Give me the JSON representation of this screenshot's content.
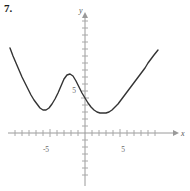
{
  "problem": {
    "number": "7."
  },
  "axes": {
    "x_axis_label": "x",
    "y_axis_label": "y",
    "x_tick_labels": [
      {
        "text": "-5",
        "value": -5
      },
      {
        "text": "5",
        "value": 5
      }
    ],
    "y_tick_labels": [
      {
        "text": "5",
        "value": 5
      }
    ],
    "axis_color": "#9a9a9a",
    "tick_color": "#a8a8a8",
    "label_color": "#6b6b6b"
  },
  "chart_data": {
    "type": "line",
    "title": "",
    "subtitle": "",
    "xlabel": "x",
    "ylabel": "y",
    "xlim": [
      -11,
      12
    ],
    "ylim": [
      -7,
      22
    ],
    "grid": false,
    "legend": null,
    "x_ticks": [
      -10,
      -9,
      -8,
      -7,
      -6,
      -5,
      -4,
      -3,
      -2,
      -1,
      1,
      2,
      3,
      4,
      5,
      6,
      7,
      8,
      9,
      10
    ],
    "x_tick_labels_shown": [
      -5,
      5
    ],
    "y_ticks": [
      -6,
      -5,
      -4,
      -3,
      -2,
      -1,
      1,
      2,
      3,
      4,
      5,
      6,
      7,
      8,
      9,
      10,
      11,
      12,
      13,
      14,
      15,
      16,
      17,
      18,
      19,
      20
    ],
    "y_tick_labels_shown": [
      5
    ],
    "tick_unit_px": 7,
    "origin_px": {
      "x": 85,
      "y": 133
    },
    "series": [
      {
        "name": "quartic-curve",
        "color": "#333333",
        "line_width": 1.4,
        "description": "W-shaped quartic with two local minima and one local maximum, entirely above the x-axis",
        "features": {
          "left_endpoint": {
            "x": -10.7,
            "y": 12.1
          },
          "local_min_left": {
            "x": -6.0,
            "y": 3.3
          },
          "local_max": {
            "x": -2.9,
            "y": 8.3
          },
          "local_min_right": {
            "x": 2.9,
            "y": 2.9
          },
          "right_endpoint": {
            "x": 10.4,
            "y": 11.9
          }
        },
        "points_px": [
          [
            10,
            48
          ],
          [
            13,
            56
          ],
          [
            16,
            63
          ],
          [
            19,
            70
          ],
          [
            22,
            77
          ],
          [
            25,
            83
          ],
          [
            28,
            89
          ],
          [
            31,
            95
          ],
          [
            34,
            100
          ],
          [
            37,
            104
          ],
          [
            40,
            108
          ],
          [
            43,
            110
          ],
          [
            46,
            110
          ],
          [
            49,
            108
          ],
          [
            52,
            104
          ],
          [
            55,
            99
          ],
          [
            58,
            93
          ],
          [
            61,
            86
          ],
          [
            64,
            79
          ],
          [
            67,
            75
          ],
          [
            70,
            74
          ],
          [
            73,
            76
          ],
          [
            76,
            81
          ],
          [
            79,
            87
          ],
          [
            82,
            93
          ],
          [
            85,
            98
          ],
          [
            88,
            103
          ],
          [
            91,
            107
          ],
          [
            94,
            110
          ],
          [
            97,
            112
          ],
          [
            100,
            113
          ],
          [
            103,
            113
          ],
          [
            106,
            113
          ],
          [
            109,
            112
          ],
          [
            112,
            110
          ],
          [
            115,
            107
          ],
          [
            118,
            104
          ],
          [
            121,
            100
          ],
          [
            124,
            96
          ],
          [
            127,
            92
          ],
          [
            130,
            88
          ],
          [
            133,
            84
          ],
          [
            136,
            80
          ],
          [
            139,
            76
          ],
          [
            142,
            72
          ],
          [
            145,
            68
          ],
          [
            148,
            63
          ],
          [
            151,
            59
          ],
          [
            154,
            55
          ],
          [
            158,
            50
          ]
        ]
      }
    ]
  }
}
